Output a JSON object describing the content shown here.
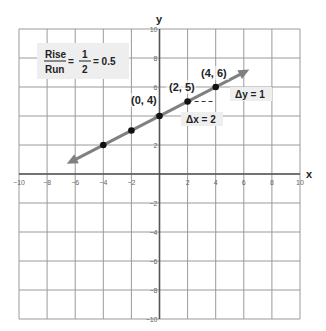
{
  "chart_data": {
    "type": "line",
    "title": "",
    "xlabel": "x",
    "ylabel": "y",
    "xlim": [
      -10,
      10
    ],
    "ylim": [
      -10,
      10
    ],
    "grid": true,
    "x_ticks": [
      -10,
      -8,
      -6,
      -4,
      -2,
      2,
      4,
      6,
      8,
      10
    ],
    "y_ticks": [
      10,
      8,
      6,
      4,
      2,
      -2,
      -4,
      -6,
      -8,
      -10
    ],
    "x_tick_labels": [
      "−10",
      "−8",
      "−6",
      "−4",
      "−2",
      "2",
      "4",
      "6",
      "8",
      "10"
    ],
    "y_tick_labels": [
      "10",
      "8",
      "6",
      "4",
      "2",
      "−2",
      "−4",
      "−6",
      "−8",
      "−10"
    ],
    "line": {
      "equation": "y = 0.5x + 4",
      "slope": 0.5,
      "intercept": 4,
      "x_start": -6.6,
      "x_end": 6.4,
      "arrows": "both",
      "color": "#808080"
    },
    "series": [
      {
        "name": "points",
        "x": [
          -4,
          -2,
          0,
          2,
          4
        ],
        "y": [
          2,
          3,
          4,
          5,
          6
        ],
        "color": "#111111"
      }
    ],
    "point_labels": [
      {
        "text": "(0, 4)",
        "x": 0,
        "y": 4
      },
      {
        "text": "(2, 5)",
        "x": 2,
        "y": 5
      },
      {
        "text": "(4, 6)",
        "x": 4,
        "y": 6
      }
    ],
    "annotations": {
      "delta_x": "Δx = 2",
      "delta_y": "Δy = 1",
      "formula": {
        "rise": "Rise",
        "run": "Run",
        "num": "1",
        "den": "2",
        "eq1": "=",
        "eq2": "= 0.5"
      }
    }
  },
  "colors": {
    "grid": "#9a9a9a",
    "axis": "#555555",
    "line": "#808080",
    "point": "#111111",
    "label_bg": "#eeeeee"
  }
}
